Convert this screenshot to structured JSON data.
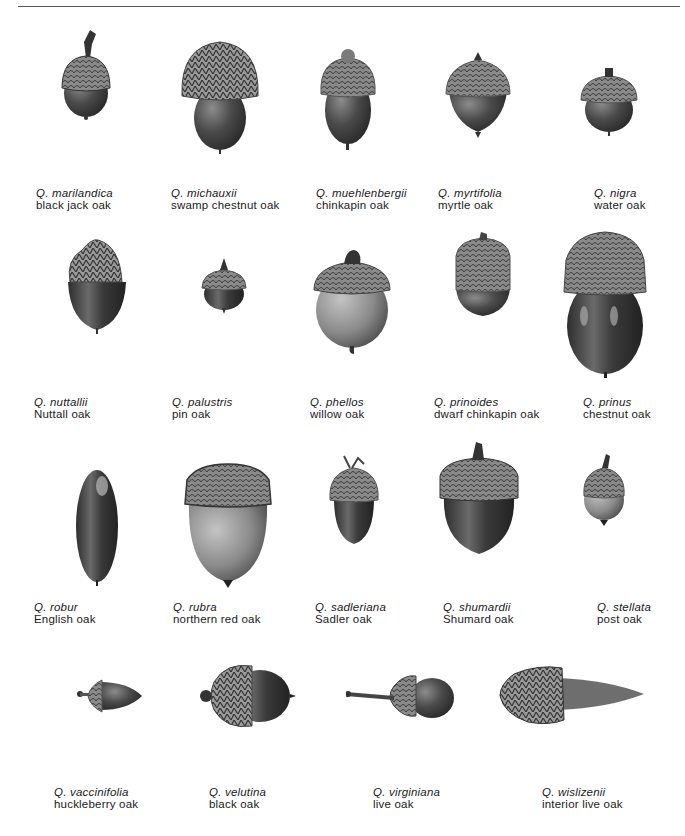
{
  "rows": [
    {
      "items": [
        {
          "scientific": "Q. marilandica",
          "common": "black jack oak"
        },
        {
          "scientific": "Q. michauxii",
          "common": "swamp chestnut oak"
        },
        {
          "scientific": "Q. muehlenbergii",
          "common": "chinkapin oak"
        },
        {
          "scientific": "Q. myrtifolia",
          "common": "myrtle oak"
        },
        {
          "scientific": "Q. nigra",
          "common": "water oak"
        }
      ]
    },
    {
      "items": [
        {
          "scientific": "Q. nuttallii",
          "common": "Nuttall oak"
        },
        {
          "scientific": "Q. palustris",
          "common": "pin oak"
        },
        {
          "scientific": "Q. phellos",
          "common": "willow oak"
        },
        {
          "scientific": "Q. prinoides",
          "common": "dwarf chinkapin oak"
        },
        {
          "scientific": "Q. prinus",
          "common": "chestnut oak"
        }
      ]
    },
    {
      "items": [
        {
          "scientific": "Q. robur",
          "common": "English oak"
        },
        {
          "scientific": "Q. rubra",
          "common": "northern red oak"
        },
        {
          "scientific": "Q. sadleriana",
          "common": "Sadler oak"
        },
        {
          "scientific": "Q. shumardii",
          "common": "Shumard oak"
        },
        {
          "scientific": "Q. stellata",
          "common": "post oak"
        }
      ]
    },
    {
      "items": [
        {
          "scientific": "Q. vaccinifolia",
          "common": "huckleberry oak"
        },
        {
          "scientific": "Q. velutina",
          "common": "black oak"
        },
        {
          "scientific": "Q. virginiana",
          "common": "live oak"
        },
        {
          "scientific": "Q. wislizenii",
          "common": "interior live oak"
        }
      ]
    }
  ],
  "colors": {
    "ink": "#1a1a1a",
    "cap": "#6e6e6e",
    "nut": "#3a3a3a",
    "rule": "#555555"
  }
}
